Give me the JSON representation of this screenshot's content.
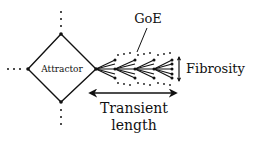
{
  "diagram": {
    "type": "schematic",
    "colors": {
      "ink": "#111111",
      "background": "#ffffff"
    },
    "nodes": {
      "attractor": {
        "label": "Attractor",
        "shape": "diamond"
      }
    },
    "labels": {
      "goe": "GoE",
      "fibrosity": "Fibrosity",
      "transient_line1": "Transient",
      "transient_line2": "length"
    },
    "annotations": {
      "goe_pointer": "line from GoE label to dotted envelope of branching fan",
      "fibrosity_arrow": "vertical double-headed arrow spanning fan width",
      "transient_arrow": "horizontal double-headed arrow spanning fan length",
      "dotted_stubs": [
        "top",
        "left",
        "bottom"
      ]
    }
  }
}
